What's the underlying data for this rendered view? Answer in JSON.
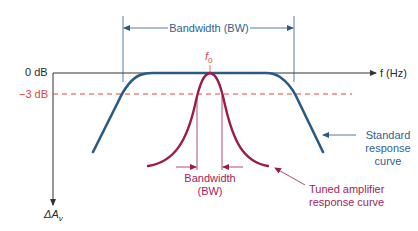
{
  "diagram": {
    "title_bandwidth_top": "Bandwidth (BW)",
    "axes": {
      "x_label": "f (Hz)",
      "y_label_main": "ΔA",
      "y_label_sub": "v",
      "zero_db": "0 dB",
      "minus3_db": "−3 dB"
    },
    "center_frequency": {
      "main": "f",
      "sub": "0"
    },
    "tuned_bandwidth": {
      "line1": "Bandwidth",
      "line2": "(BW)"
    },
    "standard_curve_label": {
      "line1": "Standard",
      "line2": "response",
      "line3": "curve"
    },
    "tuned_curve_label": {
      "line1": "Tuned amplifier",
      "line2": "response curve"
    },
    "colors": {
      "axis": "#333333",
      "standard_curve": "#2b5a85",
      "tuned_curve": "#9b1b4b",
      "minus3_line": "#e0443c",
      "label_blue": "#2f5f8f",
      "label_maroon": "#a0245a"
    }
  }
}
